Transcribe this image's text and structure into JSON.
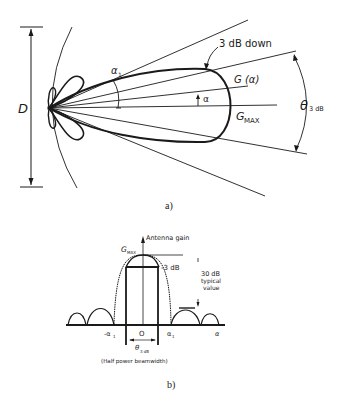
{
  "figure_a": {
    "caption": "a)",
    "labels": {
      "diameter": "D",
      "first_null_angle": "α",
      "first_null_angle_sub": "1",
      "three_db_down": "3 dB down",
      "gain_at_angle": "G (α)",
      "angle": "α",
      "gain_max": "G",
      "gain_max_sub": "MAX",
      "beamwidth": "θ",
      "beamwidth_sub": "3 dB"
    }
  },
  "figure_b": {
    "caption": "b)",
    "labels": {
      "y_axis": "Antenna gain",
      "gain_max": "G",
      "gain_max_sub": "MAX",
      "minus_3db": "-3 dB",
      "sidelobe_note_line1": "30 dB",
      "sidelobe_note_line2": "typical",
      "sidelobe_note_line3": "value",
      "neg_first_null": "-α",
      "neg_first_null_sub": "1",
      "origin": "O",
      "pos_first_null": "α",
      "pos_first_null_sub": "1",
      "x_axis": "α",
      "beamwidth": "θ",
      "beamwidth_sub": "3 dB",
      "beamwidth_note": "(Half power beamwidth)"
    }
  }
}
